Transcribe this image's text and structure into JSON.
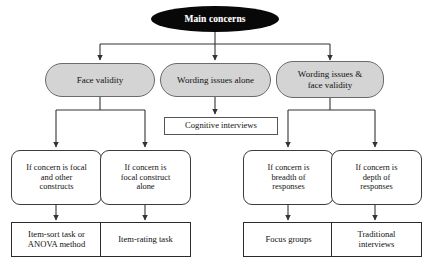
{
  "figure": {
    "type": "flowchart",
    "orientation": "top-down",
    "background_color": "#ffffff",
    "levels": 4
  },
  "styles": {
    "root_fill": "#080808",
    "root_text": "#ffffff",
    "level2_fill": "#d4d4d4",
    "level2_border": "#6a6a6a",
    "box_fill": "#ffffff",
    "box_border": "#2b2b2b",
    "edge_color": "#333333"
  },
  "nodes": {
    "root": {
      "label": "Main concerns",
      "shape": "ellipse",
      "fill": "#080808"
    },
    "level2": [
      {
        "id": "face-validity",
        "label": "Face validity",
        "shape": "stadium",
        "fill": "#d4d4d4"
      },
      {
        "id": "wording-issues-alone",
        "label": "Wording issues alone",
        "shape": "stadium",
        "fill": "#d4d4d4"
      },
      {
        "id": "wording-and-face",
        "label": "Wording issues &\nface validity",
        "shape": "stadium",
        "fill": "#d4d4d4"
      }
    ],
    "intermediate": [
      {
        "id": "cognitive-interviews",
        "label": "Cognitive interviews",
        "shape": "rectangle",
        "fill": "#ffffff"
      }
    ],
    "conditions": [
      {
        "id": "focal-and-other",
        "label": "If concern is focal\nand other\nconstructs",
        "shape": "rounded-rectangle",
        "fill": "#ffffff"
      },
      {
        "id": "focal-alone",
        "label": "If concern is\nfocal construct\nalone",
        "shape": "rounded-rectangle",
        "fill": "#ffffff"
      },
      {
        "id": "breadth",
        "label": "If concern is\nbreadth of\nresponses",
        "shape": "rounded-rectangle",
        "fill": "#ffffff"
      },
      {
        "id": "depth",
        "label": "If concern is\ndepth of\nresponses",
        "shape": "rounded-rectangle",
        "fill": "#ffffff"
      }
    ],
    "outcomes": [
      {
        "id": "item-sort-anova",
        "label": "Item-sort task or\nANOVA method",
        "shape": "rectangle",
        "fill": "#ffffff"
      },
      {
        "id": "item-rating",
        "label": "Item-rating task",
        "shape": "rectangle",
        "fill": "#ffffff"
      },
      {
        "id": "focus-groups",
        "label": "Focus groups",
        "shape": "rectangle",
        "fill": "#ffffff"
      },
      {
        "id": "traditional-interviews",
        "label": "Traditional\ninterviews",
        "shape": "rectangle",
        "fill": "#ffffff"
      }
    ]
  },
  "edges": [
    {
      "from": "root",
      "to": "face-validity",
      "arrow": true
    },
    {
      "from": "root",
      "to": "wording-issues-alone",
      "arrow": true
    },
    {
      "from": "root",
      "to": "wording-and-face",
      "arrow": true
    },
    {
      "from": "face-validity",
      "to": "focal-and-other",
      "arrow": true
    },
    {
      "from": "face-validity",
      "to": "focal-alone",
      "arrow": true
    },
    {
      "from": "wording-issues-alone",
      "to": "cognitive-interviews",
      "arrow": true
    },
    {
      "from": "wording-and-face",
      "to": "breadth",
      "arrow": true
    },
    {
      "from": "wording-and-face",
      "to": "depth",
      "arrow": true
    },
    {
      "from": "focal-and-other",
      "to": "item-sort-anova",
      "arrow": true
    },
    {
      "from": "focal-alone",
      "to": "item-rating",
      "arrow": true
    },
    {
      "from": "breadth",
      "to": "focus-groups",
      "arrow": true
    },
    {
      "from": "depth",
      "to": "traditional-interviews",
      "arrow": true
    }
  ]
}
